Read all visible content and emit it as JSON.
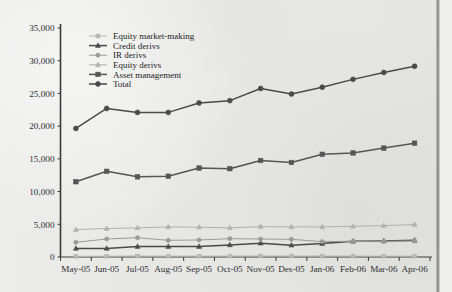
{
  "chart_data": {
    "type": "line",
    "title": "",
    "xlabel": "",
    "ylabel": "",
    "ylim": [
      0,
      35000
    ],
    "ytick_labels": [
      "0",
      "5,000",
      "10,000",
      "15,000",
      "20,000",
      "25,000",
      "30,000",
      "35,000"
    ],
    "ytick_values": [
      0,
      5000,
      10000,
      15000,
      20000,
      25000,
      30000,
      35000
    ],
    "grid": false,
    "legend_position": "top-left",
    "categories": [
      "May-05",
      "Jun-05",
      "Jul-05",
      "Aug-05",
      "Sep-05",
      "Oct-05",
      "Nov-05",
      "Des-05",
      "Jan-06",
      "Feb-06",
      "Mar-06",
      "Apr-06"
    ],
    "series": [
      {
        "name": "Equity market-making",
        "marker": "square",
        "color": "#b7b7b5",
        "values": [
          100,
          120,
          150,
          130,
          140,
          140,
          160,
          150,
          150,
          140,
          130,
          130
        ]
      },
      {
        "name": "Credit derivs",
        "marker": "triangle",
        "color": "#4a4a4a",
        "values": [
          1300,
          1300,
          1600,
          1600,
          1600,
          1850,
          2100,
          1800,
          2050,
          2400,
          2450,
          2550
        ]
      },
      {
        "name": "IR derivs",
        "marker": "circle",
        "color": "#9a9a98",
        "values": [
          2250,
          2750,
          2950,
          2550,
          2600,
          2800,
          2750,
          2700,
          2350,
          2400,
          2400,
          2450
        ]
      },
      {
        "name": "Equity derivs",
        "marker": "triangle",
        "color": "#b0b0ae",
        "values": [
          4200,
          4350,
          4450,
          4600,
          4550,
          4450,
          4650,
          4600,
          4600,
          4700,
          4800,
          4950
        ]
      },
      {
        "name": "Asset management",
        "marker": "square",
        "color": "#555555",
        "values": [
          11500,
          13100,
          12250,
          12350,
          13600,
          13500,
          14750,
          14450,
          15700,
          15900,
          16650,
          17400
        ]
      },
      {
        "name": "Total",
        "marker": "circle",
        "color": "#4a4a4a",
        "values": [
          19650,
          22700,
          22100,
          22100,
          23550,
          23900,
          25750,
          24900,
          25950,
          27150,
          28200,
          29150
        ]
      }
    ]
  }
}
